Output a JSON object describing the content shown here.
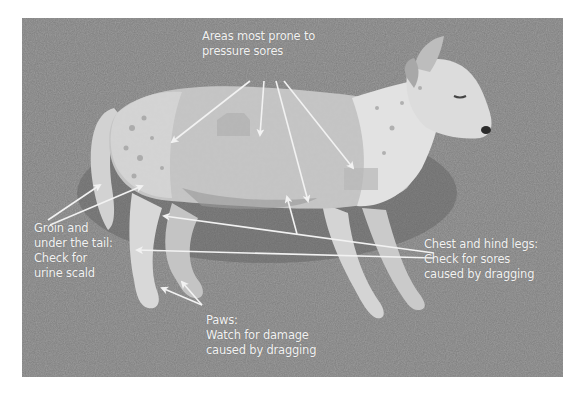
{
  "figure": {
    "colors": {
      "background": "#ffffff",
      "grass": "#7b7b7b",
      "dog": "#c8c8c8",
      "highlight_patch": "#b3b3b3",
      "annotation": "#f2f2f2"
    }
  },
  "annotations": {
    "pressure_sores": {
      "lines": [
        "Areas most prone to",
        "pressure sores"
      ]
    },
    "groin_tail": {
      "lines": [
        "Groin and",
        "under the tail:",
        "Check for",
        "urine scald"
      ]
    },
    "chest_hind_legs": {
      "lines": [
        "Chest and hind legs:",
        "Check for sores",
        "caused by dragging"
      ]
    },
    "paws": {
      "lines": [
        "Paws:",
        "Watch for damage",
        "caused by dragging"
      ]
    }
  }
}
